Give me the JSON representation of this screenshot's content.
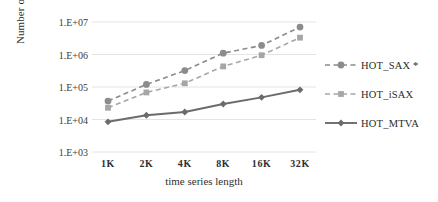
{
  "chart_data": {
    "type": "line",
    "title": "",
    "xlabel": "time series length",
    "ylabel_line1": "Number of computed distances",
    "ylabel_line2": "(log scale)",
    "categories": [
      "1K",
      "2K",
      "4K",
      "8K",
      "16K",
      "32K"
    ],
    "yscale": "log",
    "ylim": [
      1000,
      10000000
    ],
    "ytick_labels": [
      "1.E+03",
      "1.E+04",
      "1.E+05",
      "1.E+06",
      "1.E+07"
    ],
    "ytick_values": [
      1000,
      10000,
      100000,
      1000000,
      10000000
    ],
    "grid": true,
    "legend_position": "right",
    "series": [
      {
        "name": "HOT_SAX *",
        "values": [
          37000,
          120000,
          320000,
          1100000,
          1900000,
          7000000
        ],
        "color": "#8c8c8c",
        "line_style": "dashed",
        "marker": "circle"
      },
      {
        "name": "HOT_iSAX",
        "values": [
          23000,
          68000,
          130000,
          430000,
          950000,
          3300000
        ],
        "color": "#a6a6a6",
        "line_style": "dashed",
        "marker": "square"
      },
      {
        "name": "HOT_MTVA",
        "values": [
          8500,
          13500,
          17000,
          30000,
          48000,
          82000
        ],
        "color": "#6b6b6b",
        "line_style": "solid",
        "marker": "diamond"
      }
    ]
  },
  "legend": {
    "items": [
      {
        "label": "HOT_SAX *"
      },
      {
        "label": "HOT_iSAX"
      },
      {
        "label": "HOT_MTVA"
      }
    ]
  },
  "colors": {
    "series_sax": "#8c8c8c",
    "series_isax": "#a6a6a6",
    "series_mtva": "#6b6b6b",
    "gridline": "#e4e4e4",
    "text": "#3b3b3b",
    "background": "#ffffff"
  }
}
